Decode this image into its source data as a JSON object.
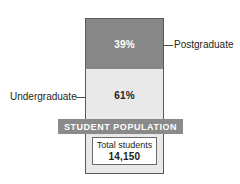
{
  "chart_data": {
    "type": "bar",
    "title": "STUDENT POPULATION",
    "categories": [
      "Undergraduate",
      "Postgraduate"
    ],
    "values": [
      61,
      39
    ],
    "value_labels": [
      "61%",
      "39%"
    ],
    "unit": "percent",
    "stacked": true,
    "orientation": "vertical",
    "xlabel": "",
    "ylabel": "",
    "ylim": [
      0,
      100
    ],
    "grid": false,
    "legend": "callout-labels",
    "annotations": [
      {
        "label": "Total students",
        "value": "14,150"
      }
    ],
    "colors": {
      "postgraduate": "#878787",
      "undergraduate": "#e9e9e9",
      "banner": "#8a8a8a",
      "outline": "#5a5a5a",
      "text": "#231f20",
      "inverse_text": "#ffffff"
    },
    "series": [
      {
        "name": "Postgraduate",
        "value": 39,
        "label": "39%",
        "color": "#878787"
      },
      {
        "name": "Undergraduate",
        "value": 61,
        "label": "61%",
        "color": "#e9e9e9"
      }
    ]
  },
  "bar": {
    "postgraduate": {
      "percent_label": "39%",
      "callout": "Postgraduate"
    },
    "undergraduate": {
      "percent_label": "61%",
      "callout": "Undergraduate"
    }
  },
  "banner": {
    "title": "STUDENT POPULATION"
  },
  "total": {
    "label": "Total students",
    "value": "14,150"
  }
}
